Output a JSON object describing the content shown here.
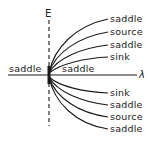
{
  "axes": {
    "vertical_label": "E",
    "horizontal_label": "λ"
  },
  "region_labels": {
    "left": "saddle",
    "right": "saddle"
  },
  "upper_branches": [
    {
      "label": "saddle"
    },
    {
      "label": "source"
    },
    {
      "label": "saddle"
    },
    {
      "label": "sink"
    }
  ],
  "lower_branches": [
    {
      "label": "sink"
    },
    {
      "label": "saddle"
    },
    {
      "label": "source"
    },
    {
      "label": "saddle"
    }
  ],
  "colors": {
    "line": "#1a1a1a",
    "background": "#ffffff"
  }
}
